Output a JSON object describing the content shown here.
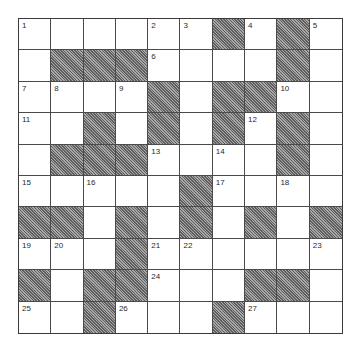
{
  "puzzle": {
    "rows": 10,
    "cols": 10,
    "colors": {
      "block_fill": "#8a8a8a",
      "grid_line": "#4a4a4a",
      "background": "#ffffff",
      "number_text": "#2a2a2a"
    },
    "legend": "W = white cell, B = blocked (hatched) cell, numbers = clue numbers",
    "grid": [
      [
        "1",
        "W",
        "W",
        "W",
        "2",
        "3",
        "B",
        "4",
        "B",
        "5"
      ],
      [
        "W",
        "B",
        "B",
        "B",
        "6",
        "W",
        "W",
        "W",
        "B",
        "W"
      ],
      [
        "7",
        "8",
        "W",
        "9",
        "B",
        "W",
        "B",
        "B",
        "10",
        "W"
      ],
      [
        "11",
        "W",
        "B",
        "W",
        "B",
        "W",
        "B",
        "12",
        "B",
        "W"
      ],
      [
        "W",
        "B",
        "B",
        "B",
        "13",
        "W",
        "14",
        "W",
        "B",
        "W"
      ],
      [
        "15",
        "W",
        "16",
        "W",
        "W",
        "B",
        "17",
        "W",
        "18",
        "W"
      ],
      [
        "B",
        "B",
        "W",
        "B",
        "W",
        "B",
        "W",
        "B",
        "W",
        "B"
      ],
      [
        "19",
        "20",
        "W",
        "B",
        "21",
        "22",
        "W",
        "W",
        "W",
        "23"
      ],
      [
        "B",
        "W",
        "B",
        "B",
        "24",
        "W",
        "W",
        "B",
        "B",
        "W"
      ],
      [
        "25",
        "W",
        "B",
        "26",
        "W",
        "W",
        "B",
        "27",
        "W",
        "W"
      ]
    ],
    "clue_numbers": [
      1,
      2,
      3,
      4,
      5,
      6,
      7,
      8,
      9,
      10,
      11,
      12,
      13,
      14,
      15,
      16,
      17,
      18,
      19,
      20,
      21,
      22,
      23,
      24,
      25,
      26,
      27
    ]
  }
}
